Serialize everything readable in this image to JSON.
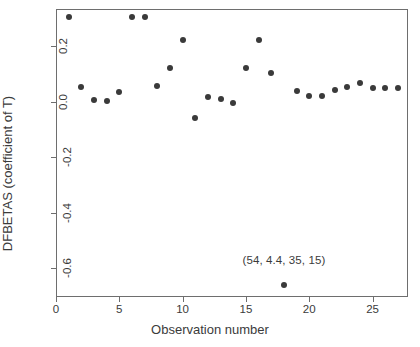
{
  "chart_data": {
    "type": "scatter",
    "title": "",
    "xlabel": "Observation number",
    "ylabel": "DFBETAS (coefficient of T)",
    "xlim": [
      0,
      27.8
    ],
    "ylim": [
      -0.705,
      0.335
    ],
    "grid": false,
    "legend": null,
    "xticks": [
      0,
      5,
      10,
      15,
      20,
      25
    ],
    "xticklabels": [
      "0",
      "5",
      "10",
      "15",
      "20",
      "25"
    ],
    "yticks": [
      0.2,
      0.0,
      -0.2,
      -0.4,
      -0.6
    ],
    "yticklabels": [
      "0.2",
      "0.0",
      "-0.2",
      "-0.4",
      "-0.6"
    ],
    "marker": "filled-circle",
    "marker_color": "#3a3a3a",
    "x": [
      1,
      2,
      3,
      4,
      5,
      6,
      7,
      8,
      9,
      10,
      11,
      12,
      13,
      14,
      15,
      16,
      17,
      18,
      19,
      20,
      21,
      22,
      23,
      24,
      25,
      26,
      27
    ],
    "y": [
      0.305,
      0.055,
      0.008,
      0.001,
      0.037,
      0.305,
      0.305,
      0.056,
      0.122,
      0.222,
      -0.057,
      0.017,
      0.009,
      -0.005,
      0.123,
      0.224,
      0.103,
      -0.663,
      0.039,
      0.022,
      0.021,
      0.041,
      0.052,
      0.066,
      0.051,
      0.051,
      0.051
    ],
    "annotations": [
      {
        "text": "(54, 4.4, 35, 15)",
        "x": 18,
        "y": -0.6
      }
    ]
  },
  "axes": {
    "frame_color": "#6e6e6e",
    "background": "#ffffff"
  }
}
